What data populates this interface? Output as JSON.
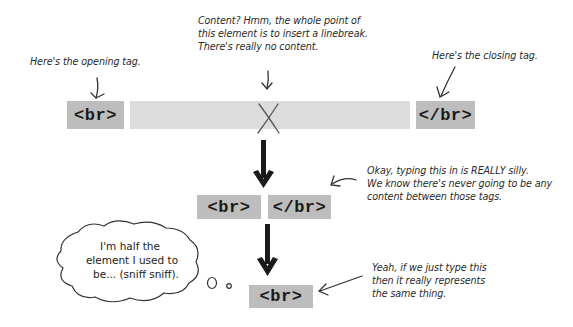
{
  "diagram": {
    "annotations": {
      "opening_tag": "Here's the opening tag.",
      "content": [
        "Content? Hmm, the whole point of",
        "this element is to insert a linebreak.",
        "There's really no content."
      ],
      "closing_tag": "Here's the closing tag.",
      "silly": [
        "Okay, typing this in is REALLY silly.",
        "We know there's never going to be any",
        "content between those tags."
      ],
      "same_thing": [
        "Yeah, if we just type this",
        "then it really represents",
        "the same thing."
      ]
    },
    "thought_bubble": [
      "I'm half the",
      "element I used to",
      "be... (sniff sniff)."
    ],
    "row1": {
      "open_tag": "<br>",
      "close_tag": "</br>"
    },
    "row2": {
      "open_tag": "<br>",
      "close_tag": "</br>"
    },
    "row3": {
      "tag": "<br>"
    },
    "colors": {
      "tag_bg": "#bdbdbd",
      "content_bar": "#dcdcdc",
      "ink": "#1a1a1a"
    }
  }
}
